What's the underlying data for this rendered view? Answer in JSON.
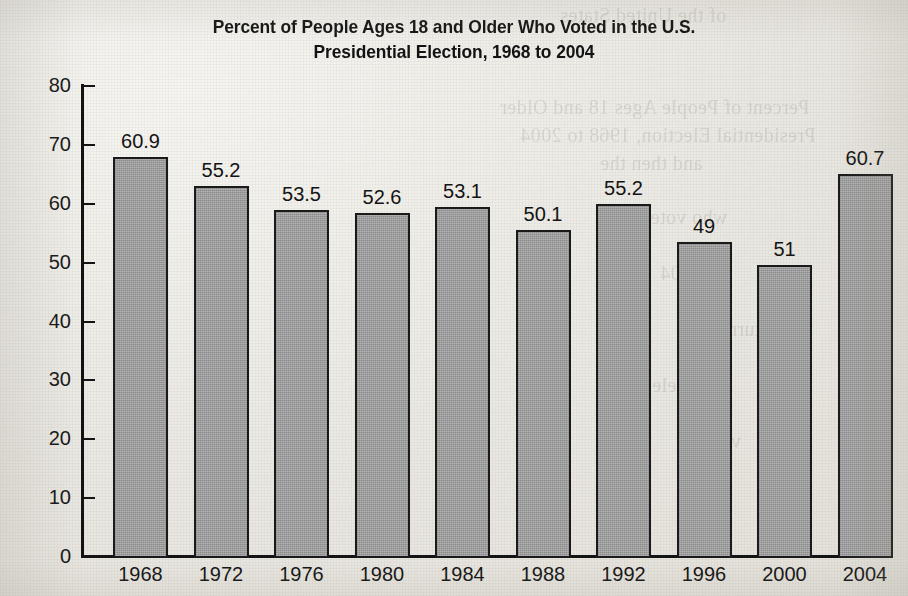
{
  "title": {
    "line1": "Percent of People Ages 18 and Older Who Voted in the U.S.",
    "line2": "Presidential Election, 1968 to 2004"
  },
  "colors": {
    "bar_fill": "#9b9b9b",
    "bar_border": "#1a1a1a",
    "ink": "#131313",
    "paper": "#eceae4"
  },
  "ghost_text": [
    {
      "text": "of the United States",
      "x": 560,
      "y": 4
    },
    {
      "text": "Percent of People Ages 18 and Older",
      "x": 500,
      "y": 96
    },
    {
      "text": "Presidential Election, 1968 to 2004",
      "x": 520,
      "y": 124
    },
    {
      "text": "and then the",
      "x": 600,
      "y": 152
    },
    {
      "text": "who voted",
      "x": 640,
      "y": 206
    },
    {
      "text": "in 2004",
      "x": 660,
      "y": 262
    },
    {
      "text": "turnout",
      "x": 700,
      "y": 318
    },
    {
      "text": "election",
      "x": 610,
      "y": 374
    },
    {
      "text": "voters",
      "x": 690,
      "y": 430
    }
  ],
  "chart_data": {
    "type": "bar",
    "title": "Percent of People Ages 18 and Older Who Voted in the U.S. Presidential Election, 1968 to 2004",
    "xlabel": "",
    "ylabel": "",
    "categories": [
      "1968",
      "1972",
      "1976",
      "1980",
      "1984",
      "1988",
      "1992",
      "1996",
      "2000",
      "2004"
    ],
    "values": [
      60.9,
      55.2,
      53.5,
      52.6,
      53.1,
      50.1,
      55.2,
      49,
      51,
      60.7
    ],
    "value_labels": [
      "60.9",
      "55.2",
      "53.5",
      "52.6",
      "53.1",
      "50.1",
      "55.2",
      "49",
      "51",
      "60.7"
    ],
    "drawn_heights": [
      67.8,
      62.8,
      58.7,
      58.3,
      59.2,
      55.4,
      59.8,
      53.4,
      49.4,
      64.8
    ],
    "ylim": [
      0,
      80
    ],
    "yticks": [
      0,
      10,
      20,
      30,
      40,
      50,
      60,
      70,
      80
    ],
    "ytick_labels": [
      "0",
      "10",
      "20",
      "30",
      "40",
      "50",
      "60",
      "70",
      "80"
    ],
    "grid": false,
    "legend": false
  }
}
